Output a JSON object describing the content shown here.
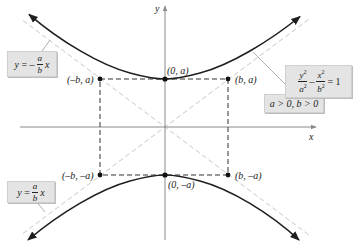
{
  "figure": {
    "axes": {
      "x_label": "x",
      "y_label": "y"
    },
    "points": [
      {
        "id": "vertex-top",
        "label": "(0, a)"
      },
      {
        "id": "vertex-bottom",
        "label": "(0, –a)"
      },
      {
        "id": "corner-top-left",
        "label": "(–b, a)"
      },
      {
        "id": "corner-top-right",
        "label": "(b, a)"
      },
      {
        "id": "corner-bottom-left",
        "label": "(–b, –a)"
      },
      {
        "id": "corner-bottom-right",
        "label": "(b, –a)"
      }
    ],
    "callouts": {
      "neg_asymptote": {
        "lhs": "y",
        "eq": "=",
        "sign": "–",
        "num": "a",
        "den": "b",
        "var": "x"
      },
      "pos_asymptote": {
        "lhs": "y",
        "eq": "=",
        "num": "a",
        "den": "b",
        "var": "x"
      },
      "equation": {
        "num1": "y",
        "den1": "a",
        "num2": "x",
        "den2": "b",
        "exp": "2",
        "minus": "–",
        "eq": "=",
        "rhs": "1"
      },
      "condition": "a > 0, b > 0"
    },
    "colors": {
      "curve": "#1f1f1f",
      "axes": "#8a8a8a",
      "asymptote": "#c8c8c8",
      "rectangle": "#333333",
      "callout_bg": "#e4e4e4"
    }
  }
}
